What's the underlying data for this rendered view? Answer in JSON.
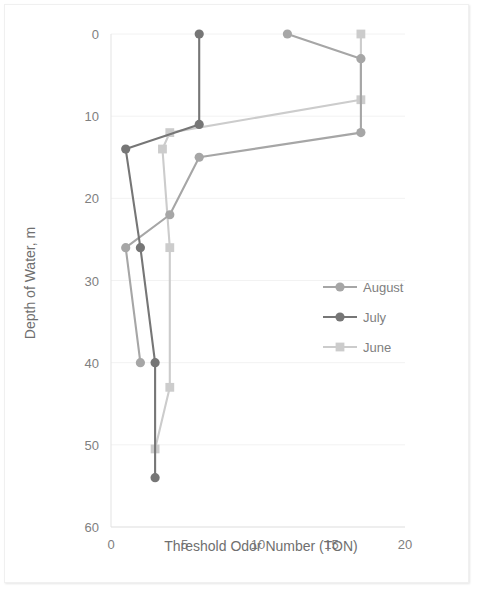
{
  "chart_data": {
    "type": "line",
    "title": "",
    "xlabel": "Threshold Odor Number (TON)",
    "ylabel": "Depth of Water, m",
    "xlim": [
      0,
      20
    ],
    "ylim": [
      0,
      60
    ],
    "y_inverted": true,
    "xticks": [
      0,
      5,
      10,
      15,
      20
    ],
    "yticks": [
      0,
      10,
      20,
      30,
      40,
      50,
      60
    ],
    "grid": "horizontal",
    "legend_position": "center-right",
    "orientation": "x=TON, y=depth (depth increases downward)",
    "series": [
      {
        "name": "August",
        "color": "#a6a6a6",
        "marker": "circle",
        "points": [
          {
            "ton": 12.0,
            "depth": 0
          },
          {
            "ton": 17.0,
            "depth": 3.0
          },
          {
            "ton": 17.0,
            "depth": 12.0
          },
          {
            "ton": 6.0,
            "depth": 15.0
          },
          {
            "ton": 4.0,
            "depth": 22.0
          },
          {
            "ton": 1.0,
            "depth": 26.0
          },
          {
            "ton": 2.0,
            "depth": 40.0
          }
        ]
      },
      {
        "name": "July",
        "color": "#767676",
        "marker": "circle",
        "points": [
          {
            "ton": 6.0,
            "depth": 0
          },
          {
            "ton": 6.0,
            "depth": 11.0
          },
          {
            "ton": 1.0,
            "depth": 14.0
          },
          {
            "ton": 2.0,
            "depth": 26.0
          },
          {
            "ton": 3.0,
            "depth": 40.0
          },
          {
            "ton": 3.0,
            "depth": 54.0
          }
        ]
      },
      {
        "name": "June",
        "color": "#cccccc",
        "marker": "square",
        "points": [
          {
            "ton": 17.0,
            "depth": 0
          },
          {
            "ton": 17.0,
            "depth": 8.0
          },
          {
            "ton": 4.0,
            "depth": 12.0
          },
          {
            "ton": 3.5,
            "depth": 14.0
          },
          {
            "ton": 4.0,
            "depth": 26.0
          },
          {
            "ton": 4.0,
            "depth": 43.0
          },
          {
            "ton": 3.0,
            "depth": 50.5
          }
        ]
      }
    ]
  },
  "legend": {
    "items": [
      {
        "label": "August"
      },
      {
        "label": "July"
      },
      {
        "label": "June"
      }
    ]
  }
}
